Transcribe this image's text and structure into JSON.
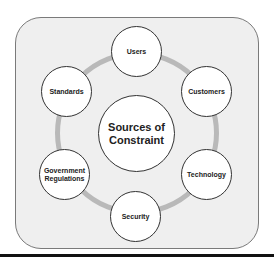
{
  "diagram": {
    "center": {
      "label_line1": "Sources of",
      "label_line2": "Constraint"
    },
    "nodes": [
      {
        "label": "Users"
      },
      {
        "label": "Customers"
      },
      {
        "label": "Technology"
      },
      {
        "label": "Security"
      },
      {
        "label_line1": "Government",
        "label_line2": "Regulations"
      },
      {
        "label": "Standards"
      }
    ]
  },
  "colors": {
    "panel": "#efefef",
    "ring": "#b9b9b9",
    "node_fill": "#ffffff",
    "outline": "#333333"
  }
}
